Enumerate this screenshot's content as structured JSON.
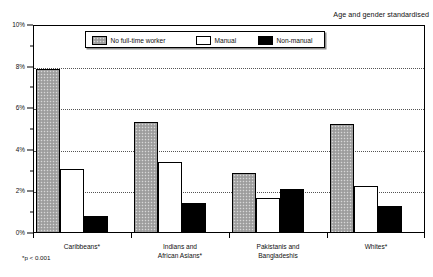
{
  "annotation": "Age and gender standardised",
  "footnote": "*p < 0.001",
  "legend": {
    "items": [
      {
        "label": "No full-time worker",
        "swatch": "grey-stipple-swatch"
      },
      {
        "label": "Manual",
        "swatch": "white-swatch"
      },
      {
        "label": "Non-manual",
        "swatch": "black-swatch"
      }
    ]
  },
  "yaxis": {
    "ticks": [
      "0%",
      "2%",
      "4%",
      "6%",
      "8%",
      "10%"
    ]
  },
  "chart_data": {
    "type": "bar",
    "title": "",
    "subtitle": "",
    "xlabel": "",
    "ylabel": "",
    "ylim": [
      0,
      10
    ],
    "ytick_values": [
      0,
      2,
      4,
      6,
      8,
      10
    ],
    "ytick_labels": [
      "0%",
      "2%",
      "4%",
      "6%",
      "8%",
      "10%"
    ],
    "yminor_step": 1,
    "grid": "horizontal-dotted",
    "legend_position": "inside-top-center",
    "annotation": "Age and gender standardised",
    "footnote": "*p < 0.001",
    "categories": [
      "Caribbeans*",
      "Indians and\nAfrican Asians*",
      "Pakistanis and\nBangladeshis",
      "Whites*"
    ],
    "series": [
      {
        "name": "No full-time worker",
        "color": "#a8a8a8",
        "values": [
          7.9,
          5.35,
          2.9,
          5.25
        ]
      },
      {
        "name": "Manual",
        "color": "#ffffff",
        "values": [
          3.1,
          3.4,
          1.7,
          2.25
        ]
      },
      {
        "name": "Non-manual",
        "color": "#000000",
        "values": [
          0.8,
          1.45,
          2.1,
          1.3
        ]
      }
    ]
  }
}
